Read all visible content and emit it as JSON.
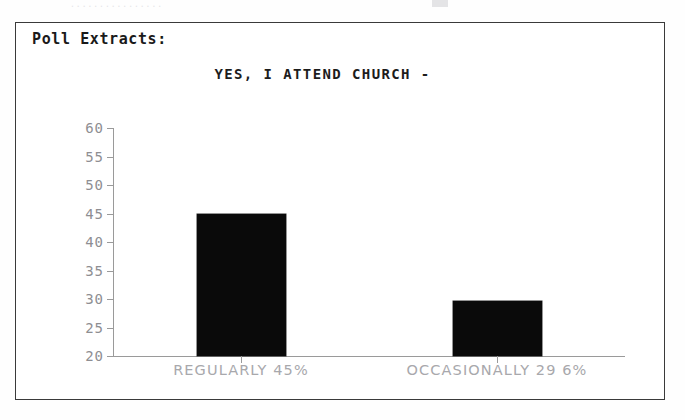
{
  "document": {
    "section_heading": "Poll Extracts:",
    "scan_artifact_text": "................"
  },
  "chart_data": {
    "type": "bar",
    "title": "YES, I ATTEND CHURCH -",
    "xlabel": "",
    "ylabel": "",
    "categories": [
      "REGULARLY  45%",
      "OCCASIONALLY  29 6%"
    ],
    "values": [
      45.0,
      29.6
    ],
    "ylim": [
      20,
      60
    ],
    "yticks": [
      60,
      55,
      50,
      45,
      40,
      35,
      30,
      25,
      20
    ],
    "ytick_labels": [
      "60",
      "55",
      "50",
      "45",
      "40",
      "35",
      "30",
      "25",
      "20"
    ],
    "grid": false,
    "legend": null,
    "bar_color": "#0a0a0a",
    "axis_color": "#9a9a9a",
    "label_color": "#a8a8ac"
  }
}
